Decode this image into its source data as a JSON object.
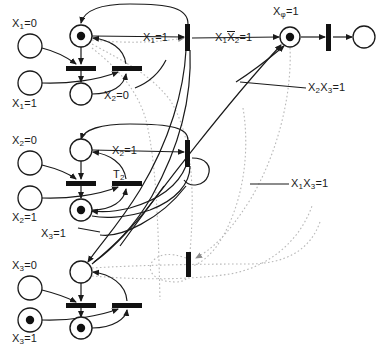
{
  "figure": {
    "type": "petri-net-diagram",
    "width": 381,
    "height": 352,
    "background": "#ffffff",
    "stroke_color": "#1a1a1a",
    "dotted_arc_color": "#b3b3b3"
  },
  "labels": {
    "x1_eq_0": "X",
    "x1_eq_0_sub": "1",
    "x1_eq_0_rest": "=0",
    "x1_eq_1": "X",
    "x1_eq_1_sub": "1",
    "x1_eq_1_rest": "=1",
    "x2_eq_0_left": "X",
    "x2_eq_0_left_sub": "2",
    "x2_eq_0_left_rest": "=0",
    "x2_eq_1_left": "X",
    "x2_eq_1_left_sub": "2",
    "x2_eq_1_left_rest": "=1",
    "x3_eq_0_left": "X",
    "x3_eq_0_left_sub": "3",
    "x3_eq_0_left_rest": "=0",
    "x3_eq_1_left": "X",
    "x3_eq_1_left_sub": "3",
    "x3_eq_1_left_rest": "=1",
    "arc_x1_eq_1": "X",
    "arc_x1_eq_1_sub": "1",
    "arc_x1_eq_1_rest": "=1",
    "arc_x2_eq_0": "X",
    "arc_x2_eq_0_sub": "2",
    "arc_x2_eq_0_rest": "=0",
    "arc_x2_eq_1": "X",
    "arc_x2_eq_1_sub": "2",
    "arc_x2_eq_1_rest": "=1",
    "arc_x3_eq_1": "X",
    "arc_x3_eq_1_sub": "3",
    "arc_x3_eq_1_rest": "=1",
    "t2_name": "T",
    "t2_sub": "2",
    "xphi_eq_1": "X",
    "xphi_sub": "φ",
    "xphi_rest": "=1",
    "guard_x1_notx2": "X",
    "guard_x1_notx2_sub1": "1",
    "guard_x1_notx2_bar": "X",
    "guard_x1_notx2_sub2": "2",
    "guard_x1_notx2_rest": "=1",
    "guard_x2x3": "X",
    "guard_x2x3_sub1": "2",
    "guard_x2x3_mid": "X",
    "guard_x2x3_sub2": "3",
    "guard_x2x3_rest": "=1",
    "guard_x1x3": "X",
    "guard_x1x3_sub1": "1",
    "guard_x1x3_mid": "X",
    "guard_x1x3_sub2": "3",
    "guard_x1x3_rest": "=1"
  },
  "places": [
    {
      "id": "p-x1-0",
      "label_key": "x1_eq_0",
      "cx": 30,
      "cy": 46,
      "r": 12,
      "tokens": 0
    },
    {
      "id": "p-x1-1",
      "label_key": "x1_eq_1",
      "cx": 30,
      "cy": 83,
      "r": 12,
      "tokens": 0
    },
    {
      "id": "p-x1-top",
      "label_key": "",
      "cx": 81,
      "cy": 36,
      "r": 11,
      "tokens": 1
    },
    {
      "id": "p-x1-bot",
      "label_key": "",
      "cx": 81,
      "cy": 94,
      "r": 11,
      "tokens": 0
    },
    {
      "id": "p-x2-0",
      "label_key": "x2_eq_0_left",
      "cx": 30,
      "cy": 163,
      "r": 12,
      "tokens": 0
    },
    {
      "id": "p-x2-1",
      "label_key": "x2_eq_1_left",
      "cx": 30,
      "cy": 198,
      "r": 12,
      "tokens": 0
    },
    {
      "id": "p-x2-top",
      "label_key": "",
      "cx": 81,
      "cy": 150,
      "r": 11,
      "tokens": 0
    },
    {
      "id": "p-x2-bot",
      "label_key": "",
      "cx": 81,
      "cy": 210,
      "r": 11,
      "tokens": 1
    },
    {
      "id": "p-x3-0",
      "label_key": "x3_eq_0_left",
      "cx": 30,
      "cy": 288,
      "r": 12,
      "tokens": 0
    },
    {
      "id": "p-x3-1",
      "label_key": "x3_eq_1_left",
      "cx": 30,
      "cy": 320,
      "r": 12,
      "tokens": 1
    },
    {
      "id": "p-x3-top",
      "label_key": "",
      "cx": 81,
      "cy": 272,
      "r": 11,
      "tokens": 0
    },
    {
      "id": "p-x3-bot",
      "label_key": "",
      "cx": 81,
      "cy": 328,
      "r": 11,
      "tokens": 1
    },
    {
      "id": "p-xphi",
      "label_key": "xphi_eq_1",
      "cx": 290,
      "cy": 37,
      "r": 10,
      "tokens": 1
    },
    {
      "id": "p-out",
      "label_key": "",
      "cx": 364,
      "cy": 37,
      "r": 11,
      "tokens": 0
    }
  ],
  "transitions": [
    {
      "id": "t-x1-left",
      "x": 75,
      "y": 66,
      "w": 26,
      "h": 5,
      "orient": "h"
    },
    {
      "id": "t-x1-right",
      "x": 113,
      "y": 66,
      "w": 26,
      "h": 5,
      "orient": "h"
    },
    {
      "id": "t-x2-left",
      "x": 75,
      "y": 181,
      "w": 26,
      "h": 5,
      "orient": "h"
    },
    {
      "id": "t-x2-right",
      "x": 113,
      "y": 181,
      "w": 26,
      "h": 5,
      "orient": "h"
    },
    {
      "id": "t-x3-left",
      "x": 75,
      "y": 303,
      "w": 26,
      "h": 5,
      "orient": "h"
    },
    {
      "id": "t-x3-right",
      "x": 113,
      "y": 303,
      "w": 26,
      "h": 5,
      "orient": "h"
    },
    {
      "id": "t-guard-x1notx2",
      "x": 186,
      "y": 26,
      "w": 5,
      "h": 24,
      "orient": "v"
    },
    {
      "id": "t-guard-x2x3",
      "x": 186,
      "y": 142,
      "w": 5,
      "h": 24,
      "orient": "v"
    },
    {
      "id": "t-guard-x1x3",
      "x": 188,
      "y": 253,
      "w": 5,
      "h": 24,
      "orient": "v"
    },
    {
      "id": "t-final",
      "x": 327,
      "y": 25,
      "w": 5,
      "h": 26,
      "orient": "v"
    }
  ],
  "annotations": [
    {
      "key": "arc_x1_eq_1",
      "x": 143,
      "y": 31
    },
    {
      "key": "arc_x2_eq_0",
      "x": 107,
      "y": 90
    },
    {
      "key": "arc_x2_eq_1",
      "x": 112,
      "y": 146
    },
    {
      "key": "t2_name",
      "x": 112,
      "y": 170
    },
    {
      "key": "arc_x3_eq_1",
      "x": 41,
      "y": 228
    },
    {
      "key": "guard_x1_notx2",
      "x": 217,
      "y": 32
    },
    {
      "key": "xphi_eq_1",
      "x": 277,
      "y": 8
    },
    {
      "key": "guard_x2x3",
      "x": 310,
      "y": 85
    },
    {
      "key": "guard_x1x3",
      "x": 293,
      "y": 182
    }
  ]
}
